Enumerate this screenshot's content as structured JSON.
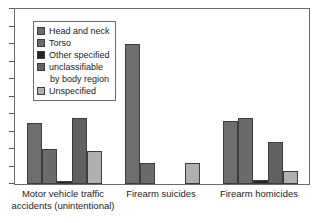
{
  "chart_data": {
    "type": "bar",
    "title": "",
    "subtitle": "",
    "xlabel": "",
    "ylabel": "",
    "ylim": [
      0,
      10
    ],
    "grid": false,
    "y_axis_tick_labels": [],
    "y_tick_count": 10,
    "legend_position": "top-left",
    "categories": [
      "Motor vehicle traffic accidents (unintentional)",
      "Firearm suicides",
      "Firearm homicides"
    ],
    "category_lines": [
      [
        "Motor vehicle traffic",
        "accidents (unintentional)"
      ],
      [
        "Firearm suicides",
        ""
      ],
      [
        "Firearm homicides",
        ""
      ]
    ],
    "series": [
      {
        "name": "Head and neck",
        "color": "#6e6e6e",
        "values": [
          3.5,
          8.0,
          3.6
        ]
      },
      {
        "name": "Torso",
        "color": "#6b6b6b",
        "values": [
          2.0,
          1.2,
          3.8
        ]
      },
      {
        "name": "Other specified",
        "color": "#262626",
        "values": [
          0.2,
          0.0,
          0.25
        ]
      },
      {
        "name": "unclassifiable by body region",
        "color": "#616161",
        "values": [
          3.8,
          0.0,
          2.4
        ]
      },
      {
        "name": "Unspecified",
        "color": "#b0b0b0",
        "values": [
          1.9,
          1.2,
          0.75
        ]
      }
    ],
    "legend_entries": [
      {
        "label": "Head and neck",
        "label2": "",
        "color": "#6e6e6e"
      },
      {
        "label": "Torso",
        "label2": "",
        "color": "#6b6b6b"
      },
      {
        "label": "Other specified",
        "label2": "",
        "color": "#262626"
      },
      {
        "label": "unclassifiable",
        "label2": "by body region",
        "color": "#616161"
      },
      {
        "label": "Unspecified",
        "label2": "",
        "color": "#b0b0b0"
      }
    ]
  },
  "figure": {
    "background_color": "#ffffff",
    "frame_color": "#6b6b6b",
    "bar_edge_color": "#3d3d3d"
  }
}
